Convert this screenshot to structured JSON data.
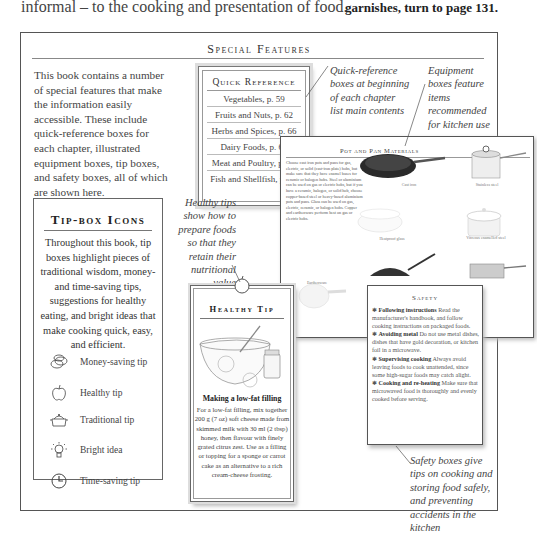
{
  "page": {
    "top_left_text": "informal – to the cooking and presentation of food.",
    "top_right_text": "garnishes, turn to page 131."
  },
  "special_features": {
    "title": "Special Features",
    "intro": "This book contains a number of special features that make the information easily accessible. These include quick-reference boxes for each chapter, illustrated equipment boxes, tip boxes, and safety boxes, all of which are shown here."
  },
  "quick_reference": {
    "title": "Quick Reference",
    "items": [
      "Vegetables, p. 59",
      "Fruits and Nuts, p. 62",
      "Herbs and Spices, p. 66",
      "Dairy Foods, p. 68",
      "Meat and Poultry, p. 71",
      "Fish and Shellfish, p. 74"
    ],
    "caption": "Quick-reference boxes at beginning of each chapter list main contents"
  },
  "equipment": {
    "caption": "Equipment boxes feature items recommended for kitchen use",
    "title": "Pot and Pan Materials",
    "text": "Choose cast iron pots and pans for gas, electric, or solid (cast-iron plate) hobs, but make sure that they have enamel bases for ceramic or halogen hobs. Steel or aluminium can be used on gas or electric hobs, but if you have a ceramic, halogen, or solid hob, choose copper-based steel or heavy-based aluminium pots and pans. Glass can be used on gas, electric, ceramic, or halogen hobs. Copper and earthenware perform best on gas or electric hobs.",
    "items": [
      "Cast iron",
      "Stainless steel",
      "Heatproof glass",
      "Vitreous enamelled steel",
      "Earthenware"
    ]
  },
  "tip_box": {
    "title": "Tip-box Icons",
    "text": "Throughout this book, tip boxes highlight pieces of traditional wisdom, money- and time-saving tips, suggestions for healthy eating, and bright ideas that make cooking quick, easy, and efficient.",
    "icons": [
      {
        "icon": "money-saving-icon",
        "label": "Money-saving tip"
      },
      {
        "icon": "healthy-apple-icon",
        "label": "Healthy tip"
      },
      {
        "icon": "traditional-pot-icon",
        "label": "Traditional tip"
      },
      {
        "icon": "lightbulb-icon",
        "label": "Bright idea"
      },
      {
        "icon": "clock-icon",
        "label": "Time-saving tip"
      }
    ]
  },
  "healthy_tip": {
    "caption": "Healthy tips show how to prepare foods so that they retain their nutritional value",
    "title": "Healthy Tip",
    "subtitle": "Making a low-fat filling",
    "text": "For a low-fat filling, mix together 200 g (7 oz) soft cheese made from skimmed milk with 30 ml (2 tbsp) honey, then flavour with finely grated citrus zest. Use as a filling or topping for a sponge or carrot cake as an alternative to a rich cream-cheese frosting."
  },
  "safety": {
    "title": "Safety",
    "items": [
      {
        "heading": "Following instructions",
        "text": "Read the manufacturer's handbook, and follow cooking instructions on packaged foods."
      },
      {
        "heading": "Avoiding metal",
        "text": "Do not use metal dishes, dishes that have gold decoration, or kitchen foil in a microwave."
      },
      {
        "heading": "Supervising cooking",
        "text": "Always avoid leaving foods to cook unattended, since some high-sugar foods may catch alight."
      },
      {
        "heading": "Cooking and re-heating",
        "text": "Make sure that microwaved food is thoroughly and evenly cooked before serving."
      }
    ],
    "caption": "Safety boxes give tips on cooking and storing food safely, and preventing accidents in the kitchen"
  }
}
